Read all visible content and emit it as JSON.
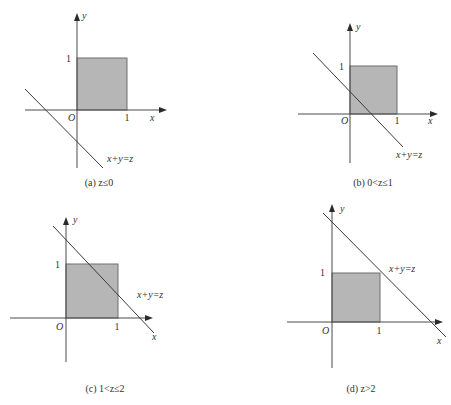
{
  "figure": {
    "colors": {
      "region_fill": "#b6b6b6",
      "region_stroke": "#6e6e6e",
      "axis": "#4a4a4a",
      "line": "#3a3a3a",
      "text": "#333333"
    },
    "panels": [
      {
        "id": "a",
        "caption": "(a) z≤0",
        "caption_pos": [
          99,
          186
        ],
        "origin": [
          77,
          110
        ],
        "unit": 50,
        "x_axis": {
          "from": 25,
          "to": 167,
          "label": "x",
          "label_pos": [
            150,
            121
          ]
        },
        "y_axis": {
          "from": 168,
          "to": 13,
          "label": "y",
          "label_pos": [
            82,
            19
          ]
        },
        "origin_label": {
          "text": "O",
          "pos": [
            68,
            121
          ]
        },
        "tick_x": {
          "text": "1",
          "pos": [
            127,
            121
          ]
        },
        "tick_y": {
          "text": "1",
          "pos": [
            71,
            62
          ]
        },
        "square": {
          "x": 77,
          "y": 58,
          "w": 50,
          "h": 52
        },
        "line": {
          "x1": 25,
          "y1": 89,
          "x2": 103,
          "y2": 168
        },
        "line_label": {
          "text": "x+y=z",
          "pos": [
            107,
            162
          ]
        },
        "condition": "z≤0"
      },
      {
        "id": "b",
        "caption": "(b) 0<z≤1",
        "caption_pos": [
          373,
          186
        ],
        "origin": [
          350,
          114
        ],
        "unit": 47,
        "x_axis": {
          "from": 298,
          "to": 438,
          "label": "x",
          "label_pos": [
            428,
            124
          ]
        },
        "y_axis": {
          "from": 163,
          "to": 23,
          "label": "y",
          "label_pos": [
            356,
            30
          ]
        },
        "origin_label": {
          "text": "O",
          "pos": [
            341,
            124
          ]
        },
        "tick_x": {
          "text": "1",
          "pos": [
            397,
            124
          ]
        },
        "tick_y": {
          "text": "1",
          "pos": [
            344,
            70
          ]
        },
        "square": {
          "x": 350,
          "y": 66,
          "w": 47,
          "h": 48
        },
        "line": {
          "x1": 313,
          "y1": 53,
          "x2": 403,
          "y2": 147
        },
        "line_label": {
          "text": "x+y=z",
          "pos": [
            396,
            158
          ]
        },
        "condition": "0<z≤1"
      },
      {
        "id": "c",
        "caption": "(c) 1<z≤2",
        "caption_pos": [
          105,
          392
        ],
        "origin": [
          66,
          318
        ],
        "unit": 52,
        "x_axis": {
          "from": 10,
          "to": 153,
          "label": "x",
          "label_pos": [
            152,
            340
          ]
        },
        "y_axis": {
          "from": 362,
          "to": 217,
          "label": "y",
          "label_pos": [
            73,
            223
          ]
        },
        "origin_label": {
          "text": "O",
          "pos": [
            56,
            330
          ]
        },
        "tick_x": {
          "text": "1",
          "pos": [
            117,
            330
          ]
        },
        "tick_y": {
          "text": "1",
          "pos": [
            60,
            268
          ]
        },
        "square": {
          "x": 66,
          "y": 264,
          "w": 52,
          "h": 54
        },
        "line": {
          "x1": 53,
          "y1": 226,
          "x2": 154,
          "y2": 333
        },
        "line_label": {
          "text": "x+y=z",
          "pos": [
            137,
            298
          ]
        },
        "condition": "1<z≤2"
      },
      {
        "id": "d",
        "caption": "(d) z>2",
        "caption_pos": [
          361,
          392
        ],
        "origin": [
          332,
          322
        ],
        "unit": 48,
        "x_axis": {
          "from": 287,
          "to": 443,
          "label": "x",
          "label_pos": [
            437,
            344
          ]
        },
        "y_axis": {
          "from": 368,
          "to": 204,
          "label": "y",
          "label_pos": [
            340,
            212
          ]
        },
        "origin_label": {
          "text": "O",
          "pos": [
            322,
            334
          ]
        },
        "tick_x": {
          "text": "1",
          "pos": [
            379,
            334
          ]
        },
        "tick_y": {
          "text": "1",
          "pos": [
            325,
            276
          ]
        },
        "square": {
          "x": 332,
          "y": 273,
          "w": 48,
          "h": 49
        },
        "line": {
          "x1": 323,
          "y1": 213,
          "x2": 446,
          "y2": 337
        },
        "line_label": {
          "text": "x+y=z",
          "pos": [
            389,
            272
          ]
        },
        "condition": "z>2"
      }
    ]
  }
}
